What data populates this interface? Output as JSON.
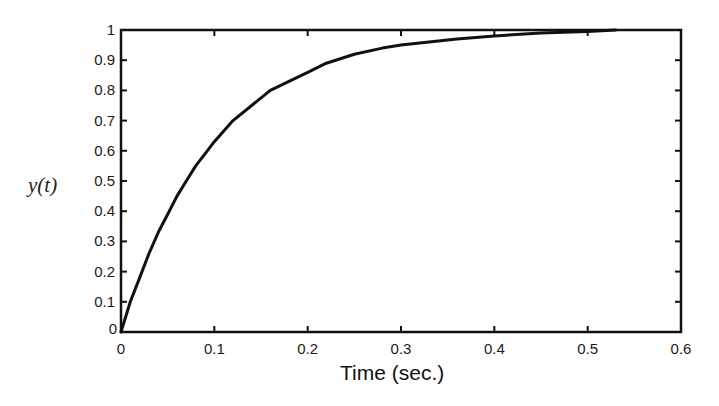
{
  "chart_data": {
    "type": "line",
    "title": "",
    "xlabel": "Time (sec.)",
    "ylabel": "y(t)",
    "xlim": [
      0,
      0.6
    ],
    "ylim": [
      0,
      1
    ],
    "xticks": [
      0,
      0.1,
      0.2,
      0.3,
      0.4,
      0.5,
      0.6
    ],
    "xtick_labels": [
      "0",
      "0.1",
      "0.2",
      "0.3",
      "0.4",
      "0.5",
      "0.6"
    ],
    "yticks": [
      0,
      0.1,
      0.2,
      0.3,
      0.4,
      0.5,
      0.6,
      0.7,
      0.8,
      0.9,
      1
    ],
    "ytick_labels": [
      "0",
      "0.1",
      "0.2",
      "0.3",
      "0.4",
      "0.5",
      "0.6",
      "0.7",
      "0.8",
      "0.9",
      "1"
    ],
    "grid": false,
    "legend": null,
    "series": [
      {
        "name": "y(t)",
        "color": "#111111",
        "x": [
          0,
          0.01,
          0.02,
          0.03,
          0.04,
          0.05,
          0.06,
          0.07,
          0.08,
          0.09,
          0.1,
          0.12,
          0.14,
          0.16,
          0.18,
          0.2,
          0.22,
          0.25,
          0.28,
          0.3,
          0.33,
          0.36,
          0.4,
          0.45,
          0.5,
          0.53
        ],
        "values": [
          0,
          0.1,
          0.18,
          0.26,
          0.33,
          0.39,
          0.45,
          0.5,
          0.55,
          0.59,
          0.63,
          0.7,
          0.75,
          0.8,
          0.83,
          0.86,
          0.89,
          0.92,
          0.94,
          0.95,
          0.96,
          0.97,
          0.98,
          0.99,
          0.995,
          1.0
        ]
      }
    ]
  },
  "colors": {
    "axis": "#111111",
    "line": "#111111",
    "background": "#ffffff"
  }
}
